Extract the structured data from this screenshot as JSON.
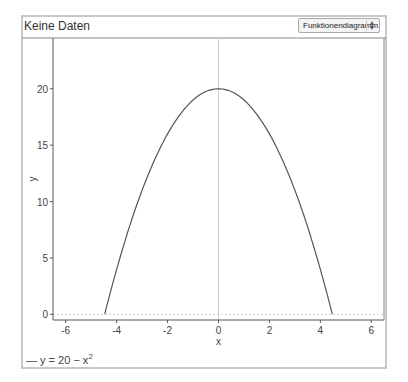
{
  "header": {
    "title": "Keine Daten",
    "view_select": "Funktionendiagramm"
  },
  "legend": {
    "line_symbol": "—",
    "label_prefix": "y = 20 − x",
    "label_exponent": "2"
  },
  "colors": {
    "curve": "#555555",
    "axis": "#555555",
    "gridline_zero": "#cccccc",
    "frame": "#c8c8c8"
  },
  "chart_data": {
    "type": "line",
    "title": "",
    "xlabel": "x",
    "ylabel": "y",
    "xlim": [
      -6.5,
      6.5
    ],
    "ylim": [
      -0.5,
      24.5
    ],
    "xticks": [
      -6,
      -4,
      -2,
      0,
      2,
      4,
      6
    ],
    "yticks": [
      0,
      5,
      10,
      15,
      20
    ],
    "grid": false,
    "zero_lines": true,
    "legend_position": "bottom-left",
    "series": [
      {
        "name": "y = 20 − x^2",
        "function": "20 - x^2",
        "x": [
          -4.47,
          -4,
          -3,
          -2,
          -1,
          0,
          1,
          2,
          3,
          4,
          4.47
        ],
        "y": [
          0,
          4,
          11,
          16,
          19,
          20,
          19,
          16,
          11,
          4,
          0
        ]
      }
    ]
  }
}
